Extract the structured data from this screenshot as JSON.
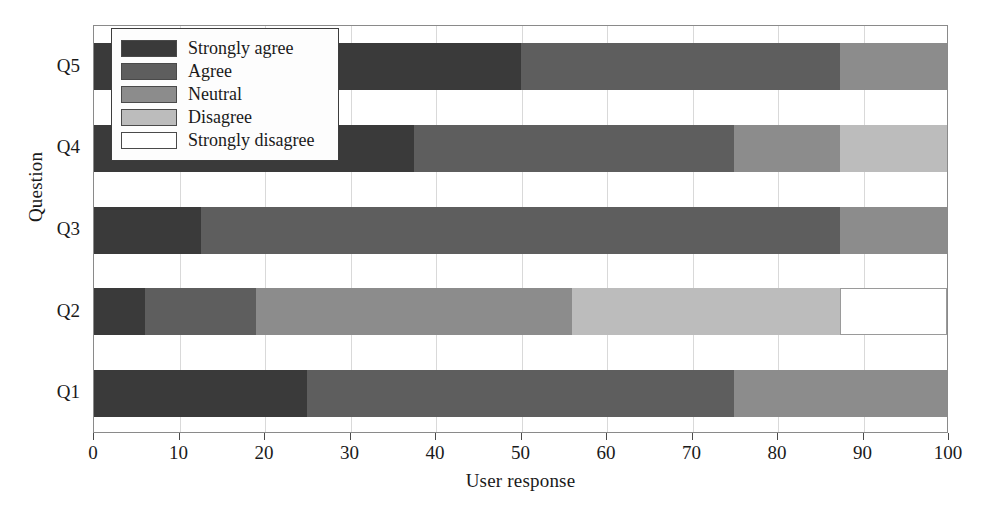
{
  "chart_data": {
    "type": "bar",
    "orientation": "horizontal",
    "stacked": true,
    "percent": true,
    "title": "",
    "xlabel": "User response",
    "ylabel": "Question",
    "xlim": [
      0,
      100
    ],
    "xticks": [
      0,
      10,
      20,
      30,
      40,
      50,
      60,
      70,
      80,
      90,
      100
    ],
    "xtick_labels": [
      "0",
      "10",
      "20",
      "30",
      "40",
      "50",
      "60",
      "70",
      "80",
      "90",
      "100"
    ],
    "categories": [
      "Q1",
      "Q2",
      "Q3",
      "Q4",
      "Q5"
    ],
    "category_order_top_to_bottom": [
      "Q5",
      "Q4",
      "Q3",
      "Q2",
      "Q1"
    ],
    "grid": "vertical",
    "legend_position": "upper left (inside axes)",
    "series": [
      {
        "name": "Strongly agree",
        "color": "#3a3a3a",
        "values": [
          25.0,
          6.0,
          12.5,
          37.5,
          50.0
        ]
      },
      {
        "name": "Agree",
        "color": "#5e5e5e",
        "values": [
          50.0,
          13.0,
          75.0,
          37.5,
          37.5
        ]
      },
      {
        "name": "Neutral",
        "color": "#8c8c8c",
        "values": [
          25.0,
          37.0,
          12.5,
          12.5,
          12.5
        ]
      },
      {
        "name": "Disagree",
        "color": "#bcbcbc",
        "values": [
          0.0,
          31.5,
          0.0,
          12.5,
          0.0
        ]
      },
      {
        "name": "Strongly disagree",
        "color": "#ffffff",
        "values": [
          0.0,
          12.5,
          0.0,
          0.0,
          0.0
        ]
      }
    ]
  },
  "legend": {
    "items": [
      {
        "label": "Strongly agree",
        "color": "#3a3a3a"
      },
      {
        "label": "Agree",
        "color": "#5e5e5e"
      },
      {
        "label": "Neutral",
        "color": "#8c8c8c"
      },
      {
        "label": "Disagree",
        "color": "#bcbcbc"
      },
      {
        "label": "Strongly disagree",
        "color": "#ffffff"
      }
    ]
  },
  "axes": {
    "x_title": "User response",
    "y_title": "Question"
  }
}
